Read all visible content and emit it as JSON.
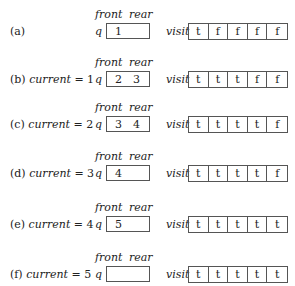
{
  "headers": {
    "front": "front",
    "rear": "rear",
    "q": "q",
    "visit": "visit"
  },
  "rows": [
    {
      "label_prefix": "(a)",
      "label_var": "",
      "label_suffix": "",
      "queue": [
        "1",
        ""
      ],
      "visit": [
        "t",
        "f",
        "f",
        "f",
        "f"
      ]
    },
    {
      "label_prefix": "(b) ",
      "label_var": "current",
      "label_suffix": " = 1",
      "queue": [
        "2",
        "3"
      ],
      "visit": [
        "t",
        "t",
        "t",
        "f",
        "f"
      ]
    },
    {
      "label_prefix": "(c) ",
      "label_var": "current",
      "label_suffix": " = 2",
      "queue": [
        "3",
        "4"
      ],
      "visit": [
        "t",
        "t",
        "t",
        "t",
        "f"
      ]
    },
    {
      "label_prefix": "(d) ",
      "label_var": "current",
      "label_suffix": " = 3",
      "queue": [
        "4",
        ""
      ],
      "visit": [
        "t",
        "t",
        "t",
        "t",
        "f"
      ]
    },
    {
      "label_prefix": "(e) ",
      "label_var": "current",
      "label_suffix": " = 4",
      "queue": [
        "5",
        ""
      ],
      "visit": [
        "t",
        "t",
        "t",
        "t",
        "t"
      ]
    },
    {
      "label_prefix": "(f) ",
      "label_var": "current",
      "label_suffix": " = 5",
      "queue": [
        "",
        ""
      ],
      "visit": [
        "t",
        "t",
        "t",
        "t",
        "t"
      ]
    }
  ]
}
